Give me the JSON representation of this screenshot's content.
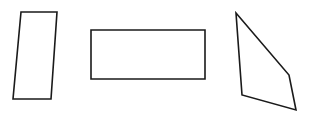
{
  "figure": {
    "background_color": "#ffffff",
    "stroke_color": "#1a1a1a",
    "stroke_width": 1.6,
    "fill": "none",
    "canvas": {
      "width": 311,
      "height": 121
    },
    "shape_count": 3,
    "shapes": [
      {
        "name": "parallelogram",
        "label": "Parallelogram",
        "sides": 4,
        "closed": true,
        "points": "21,12 57,12 51,99 13,99",
        "vertices": [
          {
            "x": 21,
            "y": 12
          },
          {
            "x": 57,
            "y": 12
          },
          {
            "x": 51,
            "y": 99
          },
          {
            "x": 13,
            "y": 99
          }
        ]
      },
      {
        "name": "rectangle",
        "label": "Rectangle",
        "sides": 4,
        "closed": true,
        "points": "91,30 205,30 205,79 91,79",
        "vertices": [
          {
            "x": 91,
            "y": 30
          },
          {
            "x": 205,
            "y": 30
          },
          {
            "x": 205,
            "y": 79
          },
          {
            "x": 91,
            "y": 79
          }
        ]
      },
      {
        "name": "irregular-quadrilateral",
        "label": "Irregular quadrilateral",
        "sides": 4,
        "closed": true,
        "points": "236,13 289,75 296,110 242,95",
        "vertices": [
          {
            "x": 236,
            "y": 13
          },
          {
            "x": 289,
            "y": 75
          },
          {
            "x": 296,
            "y": 110
          },
          {
            "x": 242,
            "y": 95
          }
        ]
      }
    ]
  }
}
